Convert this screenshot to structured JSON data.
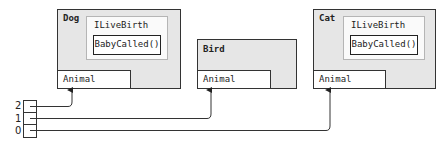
{
  "objects": [
    {
      "name": "Dog",
      "interface": "ILiveBirth",
      "method": "BabyCalled()",
      "base": "Animal"
    },
    {
      "name": "Bird",
      "base": "Animal"
    },
    {
      "name": "Cat",
      "interface": "ILiveBirth",
      "method": "BabyCalled()",
      "base": "Animal"
    }
  ],
  "array": {
    "indices": [
      "2",
      "1",
      "0"
    ],
    "targets": {
      "2": "Dog",
      "1": "Bird",
      "0": "Cat"
    }
  }
}
